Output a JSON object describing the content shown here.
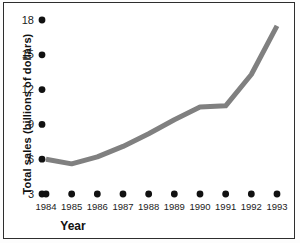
{
  "chart_data": {
    "type": "line",
    "title": "",
    "xlabel": "Year",
    "ylabel": "Total sales (billions of dollars)",
    "categories": [
      "1984",
      "1985",
      "1986",
      "1987",
      "1988",
      "1989",
      "1990",
      "1991",
      "1992",
      "1993"
    ],
    "x": [
      1984,
      1985,
      1986,
      1987,
      1988,
      1989,
      1990,
      1991,
      1992,
      1993
    ],
    "values": [
      6.0,
      5.6,
      6.2,
      7.1,
      8.2,
      9.4,
      10.5,
      10.6,
      13.3,
      17.5
    ],
    "series": [
      {
        "name": "Total sales",
        "values": [
          6.0,
          5.6,
          6.2,
          7.1,
          8.2,
          9.4,
          10.5,
          10.6,
          13.3,
          17.5
        ]
      }
    ],
    "yticks": [
      3,
      6,
      9,
      12,
      15,
      18
    ],
    "ytick_labels": [
      "3",
      "6",
      "9",
      "12",
      "15",
      "18"
    ],
    "xtick_labels": [
      "1984",
      "1985",
      "1986",
      "1987",
      "1988",
      "1989",
      "1990",
      "1991",
      "1992",
      "1993"
    ],
    "ylim": [
      3,
      18
    ],
    "xlim": [
      1984,
      1993
    ],
    "grid": false,
    "legend": false,
    "line_color": "#808080",
    "line_width": 5,
    "tick_marker": "filled-circle",
    "tick_marker_color": "#111111",
    "border_color": "#2e2e2e",
    "background_color": "#ffffff"
  }
}
